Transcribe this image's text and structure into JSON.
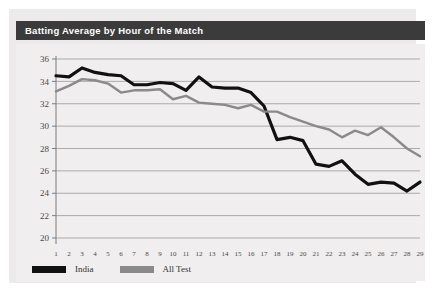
{
  "title": "Batting Average by Hour of the Match",
  "colors": {
    "title_bar": "#3c3b3b",
    "title_text": "#ffffff",
    "card_background": "#eceaea",
    "panel_background": "#f0eeee",
    "gridline": "#8e8e8e",
    "india": "#111111",
    "all_test": "#8a8a8a"
  },
  "legend": {
    "position": "bottom-left",
    "items": [
      {
        "label": "India",
        "color": "#111111",
        "swatch": "legend-swatch-india"
      },
      {
        "label": "All Test",
        "color": "#8a8a8a",
        "swatch": "legend-swatch-all-test"
      }
    ]
  },
  "chart_data": {
    "type": "line",
    "title": "Batting Average by Hour of the Match",
    "xlabel": "",
    "ylabel": "",
    "xlim": [
      1,
      29
    ],
    "ylim": [
      20,
      36
    ],
    "ytick_step": 2,
    "grid": "horizontal",
    "legend_position": "bottom-left",
    "x": [
      1,
      2,
      3,
      4,
      5,
      6,
      7,
      8,
      9,
      10,
      11,
      12,
      13,
      14,
      15,
      16,
      17,
      18,
      19,
      20,
      21,
      22,
      23,
      24,
      25,
      26,
      27,
      28,
      29
    ],
    "xtick_labels": [
      "1",
      "2",
      "3",
      "4",
      "5",
      "6",
      "7",
      "8",
      "9",
      "10",
      "11",
      "12",
      "13",
      "14",
      "15",
      "16",
      "17",
      "18",
      "19",
      "20",
      "21",
      "22",
      "23",
      "24",
      "25",
      "26",
      "27",
      "28",
      "29"
    ],
    "ytick_labels": [
      "20",
      "22",
      "24",
      "26",
      "28",
      "30",
      "32",
      "34",
      "36"
    ],
    "series": [
      {
        "name": "India",
        "color": "#111111",
        "width": 3.2,
        "values": [
          34.5,
          34.4,
          35.2,
          34.8,
          34.6,
          34.5,
          33.7,
          33.7,
          33.9,
          33.8,
          33.2,
          34.4,
          33.5,
          33.4,
          33.4,
          33.0,
          31.8,
          28.8,
          29.0,
          28.7,
          26.6,
          26.4,
          26.9,
          25.7,
          24.8,
          25.0,
          24.9,
          24.2,
          25.0
        ]
      },
      {
        "name": "All Test",
        "color": "#8a8a8a",
        "width": 2.4,
        "values": [
          33.1,
          33.6,
          34.2,
          34.1,
          33.8,
          33.0,
          33.2,
          33.2,
          33.3,
          32.4,
          32.7,
          32.1,
          32.0,
          31.9,
          31.6,
          31.9,
          31.3,
          31.3,
          30.8,
          30.4,
          30.0,
          29.7,
          29.0,
          29.6,
          29.2,
          29.9,
          29.0,
          28.0,
          27.3
        ]
      }
    ]
  }
}
